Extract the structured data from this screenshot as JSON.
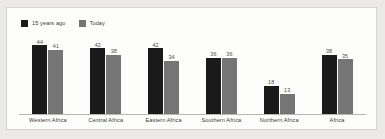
{
  "legend": {
    "position": "top-left",
    "entries": [
      {
        "label": "15 years ago",
        "color": "#1a1a1a",
        "swatch_name": "legend-swatch-15-years-ago"
      },
      {
        "label": "Today",
        "color": "#757575",
        "swatch_name": "legend-swatch-today"
      }
    ]
  },
  "colors": {
    "page_background": "#eceae6",
    "card_background": "#fdfdfc",
    "card_border": "#d7d5d1",
    "axis_line": "#b9b7b3",
    "series_past": "#1a1a1a",
    "series_today": "#757575",
    "label_text": "#3b3b3b",
    "value_text": "#4a4a4a"
  },
  "chart_data": {
    "type": "bar",
    "title": "",
    "xlabel": "",
    "ylabel": "",
    "ylim": [
      0,
      48
    ],
    "grid": false,
    "legend_position": "top-left",
    "categories": [
      "Western Africa",
      "Central Africa",
      "Eastern Africa",
      "Southern Africa",
      "Northern Africa",
      "Africa"
    ],
    "series": [
      {
        "name": "15 years ago",
        "color": "#1a1a1a",
        "values": [
          44,
          42,
          42,
          36,
          18,
          38
        ]
      },
      {
        "name": "Today",
        "color": "#757575",
        "values": [
          41,
          38,
          34,
          36,
          13,
          35
        ]
      }
    ]
  }
}
